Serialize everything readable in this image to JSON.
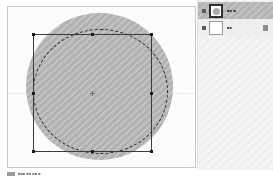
{
  "app": {
    "kind": "image-editor",
    "accent_color": "#b7b7b7",
    "panel_background": "#f4f4f4",
    "canvas_background": "#fdfdfd"
  },
  "canvas": {
    "artwork_name": "gray-circle-shape",
    "artwork_color": "#b7b7b7",
    "selection": {
      "type": "elliptical-marquee",
      "stroke": "#2c2c2c"
    },
    "transform": {
      "type": "bounding-box",
      "stroke": "#3a3a3a",
      "handle_color": "#1a1a1a",
      "handle_count": 8
    },
    "guide": {
      "orientation": "horizontal",
      "color": "#eceaea"
    }
  },
  "panel": {
    "title": "",
    "layers": [
      {
        "visible_toggle": "on",
        "name": "■■ ■",
        "thumbnail": "circle-thumbnail",
        "selected": true,
        "locked": false
      },
      {
        "visible_toggle": "on",
        "name": "■■",
        "thumbnail": "blank-thumbnail",
        "selected": false,
        "locked": true
      }
    ]
  },
  "status": {
    "text": "■■■  ■■   ■■   ■"
  }
}
